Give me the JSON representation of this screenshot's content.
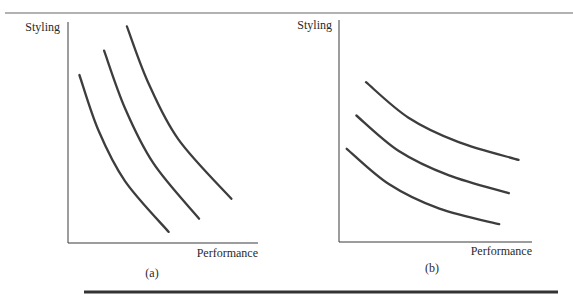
{
  "figure": {
    "top_rule": true,
    "bottom_rule": true
  },
  "chart_data": [
    {
      "type": "line",
      "panel_label": "(a)",
      "title": "",
      "xlabel": "Performance",
      "ylabel": "Styling",
      "xlim": [
        0,
        10
      ],
      "ylim": [
        0,
        10
      ],
      "grid": false,
      "ticks": false,
      "description": "Three steep convex indifference curves (styling strongly preferred)",
      "series": [
        {
          "name": "curve-1",
          "points": [
            [
              0.6,
              7.6
            ],
            [
              1.6,
              5.1
            ],
            [
              3.0,
              2.8
            ],
            [
              5.3,
              0.5
            ]
          ]
        },
        {
          "name": "curve-2",
          "points": [
            [
              1.9,
              8.7
            ],
            [
              3.0,
              6.1
            ],
            [
              4.5,
              3.6
            ],
            [
              6.9,
              1.1
            ]
          ]
        },
        {
          "name": "curve-3",
          "points": [
            [
              3.1,
              9.8
            ],
            [
              4.2,
              7.3
            ],
            [
              5.8,
              4.7
            ],
            [
              8.6,
              2.0
            ]
          ]
        }
      ]
    },
    {
      "type": "line",
      "panel_label": "(b)",
      "title": "",
      "xlabel": "Performance",
      "ylabel": "Styling",
      "xlim": [
        0,
        10
      ],
      "ylim": [
        0,
        10
      ],
      "grid": false,
      "ticks": false,
      "description": "Three flat convex indifference curves (performance strongly preferred)",
      "series": [
        {
          "name": "curve-1",
          "points": [
            [
              0.4,
              4.2
            ],
            [
              2.6,
              2.6
            ],
            [
              5.2,
              1.5
            ],
            [
              8.3,
              0.8
            ]
          ]
        },
        {
          "name": "curve-2",
          "points": [
            [
              0.9,
              5.7
            ],
            [
              3.1,
              4.1
            ],
            [
              5.7,
              3.0
            ],
            [
              8.8,
              2.2
            ]
          ]
        },
        {
          "name": "curve-3",
          "points": [
            [
              1.4,
              7.2
            ],
            [
              3.6,
              5.6
            ],
            [
              6.2,
              4.5
            ],
            [
              9.3,
              3.7
            ]
          ]
        }
      ]
    }
  ]
}
